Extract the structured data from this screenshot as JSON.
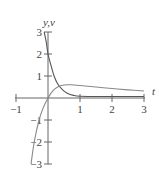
{
  "chart_data": {
    "type": "line",
    "title": "",
    "xlabel": "t",
    "ylabel": "y,v",
    "xlim": [
      -1,
      3
    ],
    "ylim": [
      -3,
      3
    ],
    "x_ticks": [
      -1,
      1,
      2,
      3
    ],
    "x_tick_labels": [
      "−1",
      "1",
      "2",
      "3"
    ],
    "y_ticks": [
      3,
      2,
      1,
      -1,
      -2,
      -3
    ],
    "y_tick_labels": [
      "3",
      "2",
      "1",
      "−1",
      "−2",
      "−3"
    ],
    "grid": false,
    "legend": "none",
    "series": [
      {
        "name": "y",
        "color": "#555555",
        "points": [
          [
            -0.12,
            3.0
          ],
          [
            -0.05,
            2.5
          ],
          [
            0,
            2.0
          ],
          [
            0.1,
            1.45
          ],
          [
            0.19,
            1.0
          ],
          [
            0.3,
            0.65
          ],
          [
            0.45,
            0.38
          ],
          [
            0.6,
            0.22
          ],
          [
            0.8,
            0.12
          ],
          [
            1.0,
            0.08
          ],
          [
            1.5,
            0.07
          ],
          [
            2.0,
            0.07
          ],
          [
            2.5,
            0.07
          ],
          [
            3.0,
            0.07
          ]
        ]
      },
      {
        "name": "v",
        "color": "#888888",
        "points": [
          [
            -0.53,
            -3.0
          ],
          [
            -0.43,
            -2.0
          ],
          [
            -0.28,
            -1.0
          ],
          [
            -0.15,
            -0.45
          ],
          [
            0,
            0.0
          ],
          [
            0.15,
            0.32
          ],
          [
            0.3,
            0.5
          ],
          [
            0.5,
            0.59
          ],
          [
            0.7,
            0.6
          ],
          [
            1.0,
            0.57
          ],
          [
            1.5,
            0.5
          ],
          [
            2.0,
            0.43
          ],
          [
            2.5,
            0.37
          ],
          [
            3.0,
            0.32
          ]
        ]
      }
    ]
  }
}
